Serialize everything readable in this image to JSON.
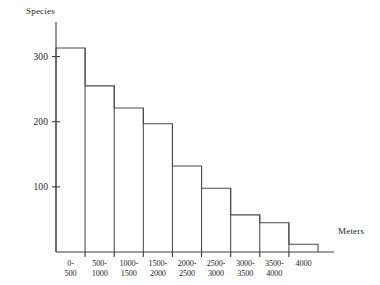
{
  "chart_data": {
    "type": "bar",
    "title": "",
    "xlabel": "Meters",
    "ylabel": "Species",
    "categories": [
      "0-500",
      "500-1000",
      "1000-1500",
      "1500-2000",
      "2000-2500",
      "2500-3000",
      "3000-3500",
      "3500-4000",
      "4000"
    ],
    "values": [
      313,
      255,
      221,
      197,
      132,
      98,
      57,
      45,
      12
    ],
    "ylim": [
      0,
      330
    ],
    "yticks": [
      100,
      200,
      300
    ],
    "ytick_labels": [
      "100",
      "200",
      "300"
    ],
    "grid": false,
    "legend": false,
    "series": [
      {
        "name": "Species",
        "values": [
          313,
          255,
          221,
          197,
          132,
          98,
          57,
          45,
          12
        ]
      }
    ]
  },
  "axes": {
    "y_axis_title": "Species",
    "x_axis_title": "Meters"
  },
  "style": {
    "bar_stroke": "#4a4a4a",
    "axis_color": "#3c3c3c",
    "background": "#ffffff",
    "text_color": "#1d1d1d"
  }
}
